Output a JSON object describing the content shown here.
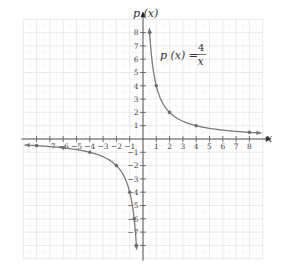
{
  "chart_data": {
    "type": "line",
    "title": "",
    "xlabel": "x",
    "ylabel": "p (x)",
    "annotation": {
      "lhs": "p (x) = ",
      "numerator": "4",
      "denominator": "x"
    },
    "xlim": [
      -9,
      9
    ],
    "ylim": [
      -9,
      9
    ],
    "grid": true,
    "x_ticks": [
      -8,
      -7,
      -6,
      -5,
      -4,
      -3,
      -2,
      -1,
      1,
      2,
      3,
      4,
      5,
      6,
      7,
      8
    ],
    "x_tick_labels": [
      "−7",
      "−6",
      "−5",
      "−4",
      "−3",
      "−2",
      "−1",
      "1",
      "2",
      "3",
      "4",
      "5",
      "6",
      "7",
      "8"
    ],
    "x_tick_label_values": [
      -7,
      -6,
      -5,
      -4,
      -3,
      -2,
      -1,
      1,
      2,
      3,
      4,
      5,
      6,
      7,
      8
    ],
    "y_ticks": [
      -8,
      -7,
      -6,
      -5,
      -4,
      -3,
      -2,
      -1,
      1,
      2,
      3,
      4,
      5,
      6,
      7,
      8
    ],
    "y_tick_labels": [
      "8",
      "7",
      "6",
      "5",
      "4",
      "3",
      "2",
      "1",
      "−1",
      "−2",
      "−3",
      "−4",
      "−5",
      "−6",
      "−7"
    ],
    "y_tick_label_values": [
      8,
      7,
      6,
      5,
      4,
      3,
      2,
      1,
      -1,
      -2,
      -3,
      -4,
      -5,
      -6,
      -7
    ],
    "series": [
      {
        "name": "p(x) = 4/x (x > 0)",
        "function": "4/x",
        "domain": [
          0.48,
          8.9
        ],
        "points": [
          [
            0.5,
            8
          ],
          [
            1,
            4
          ],
          [
            2,
            2
          ],
          [
            4,
            1
          ],
          [
            8,
            0.5
          ]
        ]
      },
      {
        "name": "p(x) = 4/x (x < 0)",
        "function": "4/x",
        "domain": [
          -8.9,
          -0.48
        ],
        "points": [
          [
            -8,
            -0.5
          ],
          [
            -6,
            -0.667
          ],
          [
            -4,
            -1
          ],
          [
            -2,
            -2
          ],
          [
            -1,
            -4
          ],
          [
            -0.667,
            -6
          ],
          [
            -0.5,
            -8
          ]
        ]
      }
    ],
    "colors": {
      "curve": "#7a7a7a",
      "grid": "#e4e4e4",
      "axis": "#555555",
      "points": "#6e6e6e"
    }
  }
}
